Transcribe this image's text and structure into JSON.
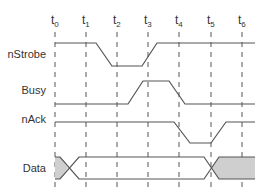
{
  "diagram": {
    "type": "timing-diagram",
    "time_markers": [
      {
        "label": "t",
        "sub": "0",
        "x": 55
      },
      {
        "label": "t",
        "sub": "1",
        "x": 86
      },
      {
        "label": "t",
        "sub": "2",
        "x": 117
      },
      {
        "label": "t",
        "sub": "3",
        "x": 148
      },
      {
        "label": "t",
        "sub": "4",
        "x": 179
      },
      {
        "label": "t",
        "sub": "5",
        "x": 211
      },
      {
        "label": "t",
        "sub": "6",
        "x": 242
      }
    ],
    "signals": [
      {
        "name": "nStrobe",
        "label_y": 58,
        "points": [
          [
            55,
            43
          ],
          [
            96,
            43
          ],
          [
            112,
            66
          ],
          [
            142,
            66
          ],
          [
            157,
            43
          ],
          [
            255,
            43
          ]
        ]
      },
      {
        "name": "Busy",
        "label_y": 94,
        "points": [
          [
            55,
            104
          ],
          [
            128,
            104
          ],
          [
            143,
            81
          ],
          [
            169,
            81
          ],
          [
            185,
            104
          ],
          [
            255,
            104
          ]
        ]
      },
      {
        "name": "nAck",
        "label_y": 123,
        "points": [
          [
            55,
            122
          ],
          [
            174,
            122
          ],
          [
            190,
            143
          ],
          [
            211,
            143
          ],
          [
            226,
            122
          ],
          [
            255,
            122
          ]
        ]
      },
      {
        "name": "Data",
        "label_y": 172,
        "type": "bus"
      }
    ],
    "colors": {
      "line": "#555555",
      "dash": "#555555",
      "fill": "#cfcfcf",
      "text": "#333333"
    }
  }
}
